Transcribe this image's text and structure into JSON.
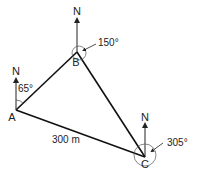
{
  "diagram": {
    "type": "bearings-triangle",
    "points": {
      "A": {
        "label": "A",
        "x": 16,
        "y": 110
      },
      "B": {
        "label": "B",
        "x": 77,
        "y": 52
      },
      "C": {
        "label": "C",
        "x": 145,
        "y": 157
      }
    },
    "north_label": "N",
    "bearings": {
      "A": "65°",
      "B": "150°",
      "C": "305°"
    },
    "side_AC": "300 m"
  }
}
